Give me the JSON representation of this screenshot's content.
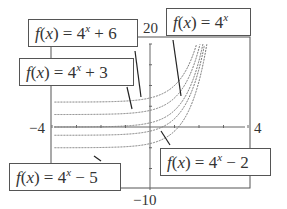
{
  "chart_data": {
    "type": "line",
    "title": "",
    "xlabel": "",
    "ylabel": "",
    "xlim": [
      -4,
      4
    ],
    "ylim": [
      -10,
      20
    ],
    "grid": false,
    "axis_tick_labels": {
      "x_min": "-4",
      "x_max": "4",
      "y_max": "20",
      "y_min": "-10"
    },
    "series": [
      {
        "name": "f(x) = 4^x + 6",
        "base": "4",
        "shift_sign": "+",
        "shift": "6",
        "k": 6
      },
      {
        "name": "f(x) = 4^x + 3",
        "base": "4",
        "shift_sign": "+",
        "shift": "3",
        "k": 3
      },
      {
        "name": "f(x) = 4^x",
        "base": "4",
        "shift_sign": "",
        "shift": "",
        "k": 0
      },
      {
        "name": "f(x) = 4^x - 2",
        "base": "4",
        "shift_sign": "−",
        "shift": "2",
        "k": -2
      },
      {
        "name": "f(x) = 4^x - 5",
        "base": "4",
        "shift_sign": "−",
        "shift": "5",
        "k": -5
      }
    ],
    "line_style": "dashed",
    "annotations": "Each curve labeled with a boxed callout and leader line"
  },
  "labels": {
    "func_prefix": "f",
    "arg": "(x) = ",
    "exp": "x"
  }
}
